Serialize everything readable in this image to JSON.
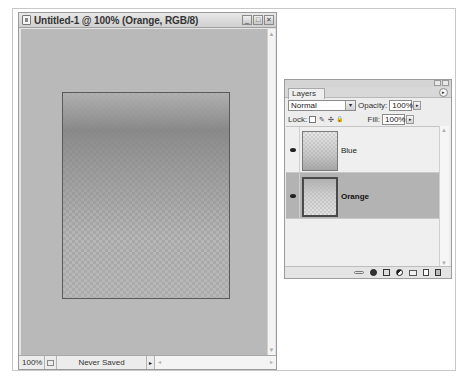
{
  "document_window": {
    "title": "Untitled-1 @ 100% (Orange, RGB/8)",
    "buttons": {
      "minimize": "_",
      "maximize": "□",
      "close": "✕"
    },
    "status_bar": {
      "zoom": "100%",
      "info": "Never Saved",
      "menu_arrow": "▸"
    },
    "scroll": {
      "up": "▲",
      "down": "▼",
      "left": "◂",
      "right": "▸"
    }
  },
  "layers_panel": {
    "tab_label": "Layers",
    "menu_icon": "▸",
    "blend_mode": "Normal",
    "blend_dropdown_icon": "▾",
    "opacity_label": "Opacity:",
    "opacity_value": "100%",
    "lock_label": "Lock:",
    "lock_icons": [
      "transparency-lock",
      "paint-lock",
      "move-lock",
      "all-lock"
    ],
    "lock_glyphs": [
      "",
      "✎",
      "✣",
      "🔒"
    ],
    "fill_label": "Fill:",
    "fill_value": "100%",
    "stepper_icon": "▸",
    "layers": [
      {
        "name": "Blue",
        "visible": true,
        "selected": false
      },
      {
        "name": "Orange",
        "visible": true,
        "selected": true
      }
    ],
    "scroll": {
      "up": "▲",
      "down": "▼"
    },
    "footer_icons": [
      "link-layers",
      "layer-style",
      "add-mask",
      "adjustment-layer",
      "new-group",
      "new-layer",
      "delete-layer"
    ]
  }
}
